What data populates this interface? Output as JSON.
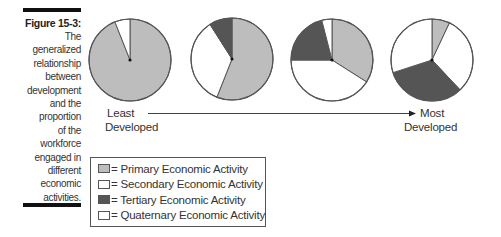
{
  "caption": {
    "title": "Figure 15-3:",
    "body_lines": [
      "The",
      "generalized",
      "relationship",
      "between",
      "development",
      "and the",
      "proportion",
      "of the",
      "workforce",
      "engaged in",
      "different",
      "economic",
      "activities."
    ]
  },
  "colors": {
    "primary": "#bdbdbd",
    "secondary": "#ffffff",
    "tertiary": "#555555",
    "quaternary": "#ffffff",
    "outline": "#555555"
  },
  "axis": {
    "left_label_line1": "Least",
    "left_label_line2": "Developed",
    "right_label_line1": "Most",
    "right_label_line2": "Developed"
  },
  "legend": {
    "items": [
      {
        "key": "primary",
        "label": "= Primary Economic Activity"
      },
      {
        "key": "secondary",
        "label": "= Secondary Economic Activity"
      },
      {
        "key": "tertiary",
        "label": "= Tertiary Economic Activity"
      },
      {
        "key": "quaternary",
        "label": "= Quaternary Economic Activity"
      }
    ]
  },
  "chart_data": {
    "type": "pie",
    "title": "Figure 15-3: The generalized relationship between development and the proportion of the workforce engaged in different economic activities.",
    "xlabel": "Least Developed → Most Developed",
    "series_names": [
      "Primary Economic Activity",
      "Secondary Economic Activity",
      "Tertiary Economic Activity",
      "Quaternary Economic Activity"
    ],
    "pies": [
      {
        "stage": "Least Developed",
        "cx": 130,
        "cy": 60,
        "r": 41,
        "slices": [
          {
            "name": "Primary",
            "value": 94
          },
          {
            "name": "Secondary",
            "value": 6
          },
          {
            "name": "Tertiary",
            "value": 0
          },
          {
            "name": "Quaternary",
            "value": 0
          }
        ]
      },
      {
        "stage": "Developing",
        "cx": 232,
        "cy": 59,
        "r": 41,
        "slices": [
          {
            "name": "Primary",
            "value": 56
          },
          {
            "name": "Secondary",
            "value": 35
          },
          {
            "name": "Tertiary",
            "value": 9
          },
          {
            "name": "Quaternary",
            "value": 0
          }
        ]
      },
      {
        "stage": "Industrialized",
        "cx": 332,
        "cy": 60,
        "r": 41,
        "slices": [
          {
            "name": "Primary",
            "value": 34
          },
          {
            "name": "Secondary",
            "value": 41
          },
          {
            "name": "Tertiary",
            "value": 21
          },
          {
            "name": "Quaternary",
            "value": 4
          }
        ]
      },
      {
        "stage": "Most Developed",
        "cx": 432,
        "cy": 60,
        "r": 41,
        "slices": [
          {
            "name": "Primary",
            "value": 7
          },
          {
            "name": "Secondary",
            "value": 31
          },
          {
            "name": "Tertiary",
            "value": 32
          },
          {
            "name": "Quaternary",
            "value": 30
          }
        ]
      }
    ],
    "legend_position": "bottom-left",
    "grid": false
  }
}
